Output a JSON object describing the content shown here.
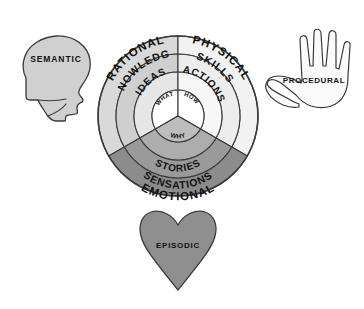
{
  "diagram": {
    "center_labels": [
      {
        "id": "what",
        "text": "WHAT"
      },
      {
        "id": "how",
        "text": "HOW"
      },
      {
        "id": "why",
        "text": "WHY"
      }
    ],
    "sectors": [
      {
        "id": "rational",
        "outer_label": "RATIONAL",
        "middle_label": "KNOWLEDGE",
        "inner_label": "IDEAS",
        "core_label": "WHAT",
        "colors": {
          "outer": "#d9d9d9",
          "middle": "#cfcfcf",
          "inner": "#e6e6e6",
          "core": "#ffffff"
        }
      },
      {
        "id": "physical",
        "outer_label": "PHYSICAL",
        "middle_label": "SKILLS",
        "inner_label": "ACTIONS",
        "core_label": "HOW",
        "colors": {
          "outer": "#f2f2f2",
          "middle": "#ededed",
          "inner": "#f7f7f7",
          "core": "#ffffff"
        }
      },
      {
        "id": "emotional",
        "outer_label": "EMOTIONAL",
        "middle_label": "SENSATIONS",
        "inner_label": "STORIES",
        "core_label": "WHY",
        "colors": {
          "outer": "#8c8c8c",
          "middle": "#9a9a9a",
          "inner": "#adadad",
          "core": "#bdbdbd"
        }
      }
    ],
    "satellites": [
      {
        "id": "semantic",
        "label": "SEMANTIC",
        "icon": "head-profile-icon",
        "fill": "#d0d0d0"
      },
      {
        "id": "procedural",
        "label": "PROCEDURAL",
        "icon": "hand-icon",
        "fill": "#fafafa"
      },
      {
        "id": "episodic",
        "label": "EPISODIC",
        "icon": "heart-icon",
        "fill": "#8f8f8f"
      }
    ],
    "stroke_color": "#3a3a3a",
    "background": "#ffffff"
  }
}
